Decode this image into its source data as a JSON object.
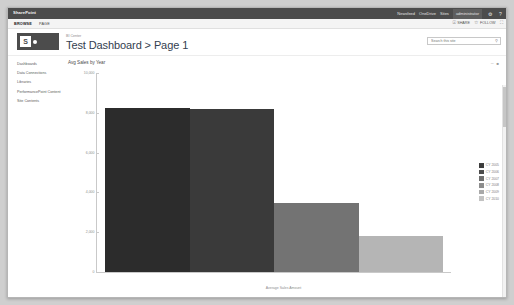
{
  "suite": {
    "brand": "SharePoint",
    "links": [
      "Newsfeed",
      "OneDrive",
      "Sites"
    ],
    "user": "administrator",
    "settings_icon": "gear-icon",
    "help_icon": "help-icon"
  },
  "ribbon": {
    "tabs": [
      {
        "label": "BROWSE",
        "active": true
      },
      {
        "label": "PAGE",
        "active": false
      }
    ],
    "actions": [
      {
        "label": "SHARE",
        "icon": "share-icon"
      },
      {
        "label": "FOLLOW",
        "icon": "follow-icon"
      }
    ],
    "focus_icon": "focus-on-content-icon"
  },
  "header": {
    "breadcrumb": "BI Center",
    "title": "Test Dashboard > Page 1",
    "logo_letter": "S"
  },
  "search": {
    "placeholder": "Search this site",
    "value": "",
    "icon": "search-icon"
  },
  "quicklaunch": {
    "items": [
      "Dashboards",
      "Data Connections",
      "Libraries",
      "PerformancePoint Content",
      "Site Contents"
    ]
  },
  "webpart": {
    "title": "Avg Sales by Year",
    "tools": [
      "minimize-icon",
      "webpart-menu-icon"
    ]
  },
  "chart_data": {
    "type": "bar",
    "title": "Avg Sales by Year",
    "xlabel": "Average Sales Amount",
    "ylabel": "",
    "categories": [
      "CY 2005",
      "CY 2006",
      "CY 2007",
      "CY 2008"
    ],
    "values": [
      8260,
      8210,
      3460,
      1830
    ],
    "ylim": [
      0,
      10000
    ],
    "yticks": [
      "10,000",
      "8,000",
      "6,000",
      "4,000",
      "2,000",
      "0"
    ],
    "ytick_values": [
      10000,
      8000,
      6000,
      4000,
      2000,
      0
    ],
    "grid": false,
    "legend_position": "right",
    "bar_colors": [
      "#2c2c2c",
      "#3a3a3a",
      "#737373",
      "#b5b5b5"
    ],
    "legend": [
      {
        "label": "CY 2005",
        "color": "#3b3b3b"
      },
      {
        "label": "CY 2006",
        "color": "#4a4a4a"
      },
      {
        "label": "CY 2007",
        "color": "#6e6e6e"
      },
      {
        "label": "CY 2008",
        "color": "#8c8c8c"
      },
      {
        "label": "CY 2009",
        "color": "#a8a8a8"
      },
      {
        "label": "CY 2010",
        "color": "#c2c2c2"
      }
    ]
  }
}
